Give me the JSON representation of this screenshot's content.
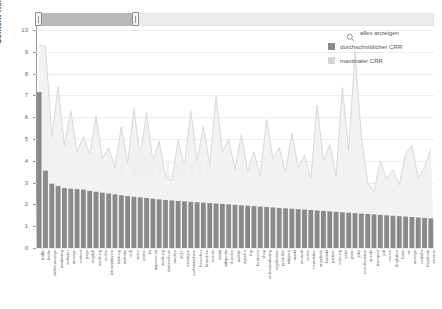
{
  "chart_data": {
    "type": "bar",
    "title": "",
    "xlabel": "",
    "ylabel": "Content Relevance Rank (CRR)",
    "ylim": [
      0,
      10
    ],
    "yticks": [
      0,
      1,
      2,
      3,
      4,
      5,
      6,
      7,
      8,
      9,
      10
    ],
    "ytick_labels": [
      "0",
      "1",
      "2",
      "3",
      "4",
      "5",
      "6",
      "7",
      "8",
      "9",
      "10"
    ],
    "grid": true,
    "legend_position": "top-right",
    "categories": [
      "traffic",
      "berlin",
      "stellenanzeige",
      "marketing",
      "anbieter",
      "anzeige",
      "content",
      "page",
      "english",
      "werbung",
      "suche",
      "informationen",
      "leistung",
      "website",
      "club",
      "video",
      "online",
      "hc",
      "impressum",
      "werbung",
      "datenschutz",
      "medien",
      "2017",
      "anzeigen",
      "suchmaschine",
      "besucher",
      "branchen",
      "events",
      "damit",
      "wikipedia",
      "kunden",
      "mobile",
      "agentur",
      "top",
      "business",
      "shop",
      "onlinemarketing",
      "ergebnisse",
      "produkte",
      "mitglied",
      "markt",
      "deutsch",
      "suche",
      "newsletter",
      "angebote",
      "kontakt",
      "partner",
      "nutzung",
      "seite",
      "preis",
      "jobs",
      "eventlocation",
      "anzahl",
      "transport",
      "job",
      "neuen",
      "flughafen",
      "hotte",
      "an",
      "anzeige",
      "verkehr",
      "facebook",
      "stoeren"
    ],
    "series": [
      {
        "name": "durchschnittlicher CRR",
        "color": "#8a8a8a",
        "values": [
          7.15,
          3.55,
          2.95,
          2.85,
          2.75,
          2.72,
          2.7,
          2.68,
          2.62,
          2.58,
          2.54,
          2.5,
          2.46,
          2.42,
          2.38,
          2.35,
          2.32,
          2.29,
          2.26,
          2.23,
          2.2,
          2.18,
          2.16,
          2.14,
          2.12,
          2.1,
          2.08,
          2.06,
          2.04,
          2.02,
          2.0,
          1.98,
          1.96,
          1.94,
          1.92,
          1.9,
          1.88,
          1.86,
          1.84,
          1.82,
          1.8,
          1.78,
          1.76,
          1.74,
          1.72,
          1.7,
          1.68,
          1.66,
          1.64,
          1.62,
          1.6,
          1.58,
          1.56,
          1.54,
          1.52,
          1.5,
          1.48,
          1.46,
          1.44,
          1.42,
          1.4,
          1.38,
          1.36
        ]
      },
      {
        "name": "maximaler CRR",
        "color": "#d8d8d8",
        "values": [
          9.3,
          9.25,
          5.1,
          7.4,
          4.7,
          6.3,
          4.4,
          5.1,
          4.3,
          6.05,
          4.1,
          4.6,
          3.7,
          5.55,
          3.9,
          6.4,
          4.2,
          6.2,
          4.0,
          4.9,
          3.3,
          3.1,
          4.95,
          3.7,
          6.3,
          4.0,
          5.6,
          3.8,
          6.95,
          4.4,
          5.0,
          3.6,
          5.2,
          3.5,
          4.4,
          3.3,
          5.9,
          4.1,
          4.6,
          3.45,
          5.25,
          3.7,
          4.25,
          3.2,
          6.55,
          4.0,
          4.75,
          3.3,
          7.35,
          4.5,
          9.0,
          5.1,
          3.0,
          2.6,
          4.0,
          3.15,
          3.6,
          2.9,
          4.3,
          4.7,
          3.2,
          3.7,
          4.55
        ]
      }
    ]
  },
  "slider": {
    "name": "range-slider",
    "min_handle_position_pct": 0,
    "max_handle_position_pct": 25,
    "track_label": ""
  },
  "legend": {
    "zoom_action_label": "alles anzeigen",
    "zoom_icon": "magnifier-icon",
    "items": [
      {
        "label": "durchschnittlicher CRR",
        "color": "#8a8a8a"
      },
      {
        "label": "maximaler CRR",
        "color": "#d6d6d6"
      }
    ]
  },
  "watermark": {
    "text": "content"
  },
  "colors": {
    "axis": "#9b9b9b",
    "grid": "#ededed",
    "bar": "#8a8a8a",
    "area_fill": "#f2f2f2",
    "area_line": "#cfcfcf",
    "text": "#5f5f5f",
    "slider_fill": "#b9b9b9",
    "slider_track": "#ececec"
  }
}
